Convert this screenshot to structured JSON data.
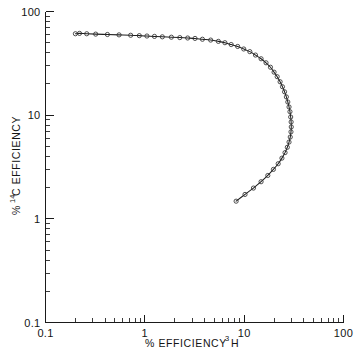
{
  "chart_data": {
    "type": "scatter",
    "title": "",
    "subtitle": "",
    "xlabel": "% EFFICIENCY 3H",
    "xlabel_parts": {
      "prefix": "% EFFICIENCY",
      "superscript": "3",
      "suffix": "H"
    },
    "ylabel": "% 14C EFFICIENCY",
    "ylabel_parts": {
      "prefix": "%",
      "superscript": "14",
      "suffix": "C EFFICIENCY"
    },
    "xscale": "log",
    "yscale": "log",
    "xlim": [
      0.1,
      100
    ],
    "ylim": [
      0.1,
      100
    ],
    "xticks": [
      "0.1",
      "1",
      "10",
      "100"
    ],
    "yticks": [
      "100",
      "10",
      "1",
      "0.1"
    ],
    "xtick_values": [
      0.1,
      1,
      10,
      100
    ],
    "ytick_values": [
      100,
      10,
      1,
      0.1
    ],
    "grid": false,
    "legend": "none",
    "marker": "open-circle",
    "line_style": "solid",
    "series": [
      {
        "name": "3H / 14C quench curve",
        "x": [
          0.2,
          0.22,
          0.26,
          0.32,
          0.42,
          0.55,
          0.72,
          0.88,
          1.05,
          1.25,
          1.5,
          1.85,
          2.25,
          2.7,
          3.2,
          3.8,
          4.6,
          5.5,
          6.4,
          7.4,
          8.6,
          9.9,
          11.4,
          13.0,
          14.8,
          16.6,
          18.4,
          20.0,
          21.5,
          23.0,
          24.3,
          25.5,
          26.6,
          27.5,
          28.3,
          28.9,
          29.4,
          29.7,
          29.8,
          29.6,
          29.1,
          28.3,
          27.2,
          25.8,
          24.0,
          22.0,
          19.7,
          17.3,
          14.8,
          12.4,
          10.2,
          8.3
        ],
        "y": [
          61.0,
          61.5,
          61.0,
          60.5,
          60.0,
          59.5,
          59.0,
          58.5,
          58.0,
          57.5,
          57.0,
          56.5,
          56.0,
          55.5,
          55.0,
          54.0,
          53.0,
          51.5,
          50.0,
          48.0,
          46.0,
          43.5,
          41.0,
          38.0,
          35.0,
          32.0,
          29.0,
          26.0,
          23.5,
          21.0,
          18.8,
          16.8,
          15.0,
          13.4,
          12.0,
          10.8,
          9.6,
          8.6,
          7.7,
          6.9,
          6.15,
          5.5,
          4.9,
          4.35,
          3.85,
          3.4,
          3.0,
          2.62,
          2.28,
          1.98,
          1.72,
          1.48
        ],
        "color": "#1e1e1e"
      }
    ]
  }
}
